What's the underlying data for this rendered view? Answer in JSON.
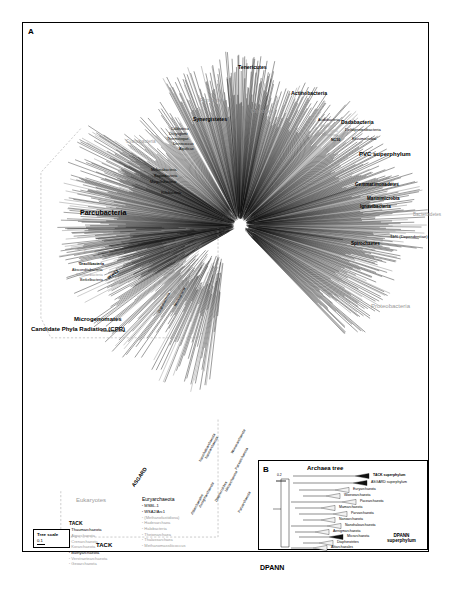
{
  "figure": {
    "panelA_letter": "A",
    "panelB_letter": "B",
    "panelB_title": "Archaea tree",
    "cpr_label": "Candidate Phyla Radiation (CPR)",
    "scale": {
      "title": "Tree scale",
      "value": "0.1"
    },
    "panelB_scale": "0.2"
  },
  "bacteria_labels": [
    {
      "text": "Tenericutes",
      "x": 215,
      "y": 42,
      "size": "s5",
      "style": "b",
      "rot": 0
    },
    {
      "text": "Firmicutes",
      "x": 177,
      "y": 75,
      "size": "s5",
      "style": "g",
      "rot": 0
    },
    {
      "text": "Chloroflexi",
      "x": 228,
      "y": 87,
      "size": "s45",
      "style": "g",
      "rot": 0
    },
    {
      "text": "Actinobacteria",
      "x": 268,
      "y": 68,
      "size": "s5",
      "style": "b",
      "rot": 0
    },
    {
      "text": "Synergistetes",
      "x": 170,
      "y": 94,
      "size": "s5",
      "style": "b",
      "rot": 0
    },
    {
      "text": "Caldiserica",
      "x": 148,
      "y": 105,
      "size": "s35",
      "style": "",
      "rot": 0
    },
    {
      "text": "Dictyoglomi",
      "x": 146,
      "y": 110,
      "size": "s35",
      "style": "",
      "rot": 0
    },
    {
      "text": "Thermotogae",
      "x": 144,
      "y": 115,
      "size": "s35",
      "style": "",
      "rot": 0
    },
    {
      "text": "Deinococcus",
      "x": 150,
      "y": 120,
      "size": "s35",
      "style": "",
      "rot": 0
    },
    {
      "text": "Aquificae",
      "x": 156,
      "y": 125,
      "size": "s35",
      "style": "",
      "rot": 0
    },
    {
      "text": "Cyanobacteria",
      "x": 103,
      "y": 117,
      "size": "s45",
      "style": "g",
      "rot": 0
    },
    {
      "text": "Melainabacteria",
      "x": 128,
      "y": 146,
      "size": "s35",
      "style": "",
      "rot": 0
    },
    {
      "text": "Saganbacteria",
      "x": 131,
      "y": 152,
      "size": "s35",
      "style": "",
      "rot": 0
    },
    {
      "text": "Margulisbacteria",
      "x": 127,
      "y": 158,
      "size": "s35",
      "style": "",
      "rot": 0
    },
    {
      "text": "Riflebacteria",
      "x": 138,
      "y": 169,
      "size": "s35",
      "style": "",
      "rot": 0
    },
    {
      "text": "Acidobacteria",
      "x": 295,
      "y": 96,
      "size": "s35",
      "style": "",
      "rot": 0
    },
    {
      "text": "Nitrospinae",
      "x": 297,
      "y": 102,
      "size": "s3",
      "style": "g2",
      "rot": 0
    },
    {
      "text": "Tectomicrobia",
      "x": 296,
      "y": 107,
      "size": "s3",
      "style": "g2",
      "rot": 0
    },
    {
      "text": "Nitrospirae",
      "x": 299,
      "y": 111,
      "size": "s3",
      "style": "g",
      "rot": 0
    },
    {
      "text": "NC10",
      "x": 308,
      "y": 116,
      "size": "s35",
      "style": "b",
      "rot": 0
    },
    {
      "text": "Dadabacteria",
      "x": 318,
      "y": 97,
      "size": "s5",
      "style": "b",
      "rot": 0
    },
    {
      "text": "Deltaproteobacteria",
      "x": 322,
      "y": 105,
      "size": "s4",
      "style": "",
      "rot": 0
    },
    {
      "text": "Elusimicrobia",
      "x": 329,
      "y": 114,
      "size": "s4",
      "style": "",
      "rot": 0
    },
    {
      "text": "PVC superphylum",
      "x": 336,
      "y": 128,
      "size": "s6",
      "style": "b",
      "rot": 0
    },
    {
      "text": "Gemmatimonadetes",
      "x": 332,
      "y": 160,
      "size": "s45",
      "style": "b",
      "rot": 0
    },
    {
      "text": "Zixibacteria",
      "x": 336,
      "y": 167,
      "size": "s4",
      "style": "g",
      "rot": 0
    },
    {
      "text": "Marinimicrobia",
      "x": 344,
      "y": 174,
      "size": "s45",
      "style": "b",
      "rot": 0
    },
    {
      "text": "Ignavibacteria",
      "x": 337,
      "y": 182,
      "size": "s45",
      "style": "b",
      "rot": 0
    },
    {
      "text": "Bacteroidetes",
      "x": 390,
      "y": 190,
      "size": "s45",
      "style": "g",
      "rot": 0
    },
    {
      "text": "TM6 (Dependentiae)",
      "x": 367,
      "y": 212,
      "size": "s4",
      "style": "",
      "rot": 0
    },
    {
      "text": "Spirochaetes",
      "x": 328,
      "y": 219,
      "size": "s45",
      "style": "b",
      "rot": 0
    },
    {
      "text": "Proteobacteria",
      "x": 348,
      "y": 280,
      "size": "s6",
      "style": "g",
      "rot": 0
    },
    {
      "text": "Parcubacteria",
      "x": 57,
      "y": 186,
      "size": "s7",
      "style": "b",
      "rot": 0
    },
    {
      "text": "Doudnabacteria",
      "x": 61,
      "y": 228,
      "size": "s35",
      "style": "g",
      "rot": 0
    },
    {
      "text": "Peregrinibacteria",
      "x": 57,
      "y": 234,
      "size": "s35",
      "style": "g",
      "rot": 0
    },
    {
      "text": "Gracilibacteria",
      "x": 56,
      "y": 240,
      "size": "s35",
      "style": "b",
      "rot": 0
    },
    {
      "text": "Absconditabacteria",
      "x": 49,
      "y": 246,
      "size": "s35",
      "style": "",
      "rot": 0
    },
    {
      "text": "Saccharibacteria",
      "x": 53,
      "y": 251,
      "size": "s35",
      "style": "g",
      "rot": 0
    },
    {
      "text": "Berkelbacteria",
      "x": 57,
      "y": 256,
      "size": "s35",
      "style": "",
      "rot": 0
    },
    {
      "text": "WWE3",
      "x": 84,
      "y": 254,
      "size": "s4",
      "style": "b",
      "rot": -38
    },
    {
      "text": "Microgenomates",
      "x": 51,
      "y": 293,
      "size": "s6",
      "style": "b",
      "rot": 0
    },
    {
      "text": "Katanobacteria",
      "x": 78,
      "y": 307,
      "size": "s35",
      "style": "",
      "rot": 0
    },
    {
      "text": "Dojkabacteria",
      "x": 135,
      "y": 289,
      "size": "s35",
      "style": "",
      "rot": -62
    },
    {
      "text": "Wirthbacteria",
      "x": 151,
      "y": 283,
      "size": "s35",
      "style": "",
      "rot": -62
    }
  ],
  "archaea_labels": [
    {
      "text": "Eukaryotes",
      "x": 53,
      "y": 474,
      "size": "s6",
      "style": "g",
      "rot": 0
    },
    {
      "text": "ASGARD",
      "x": 108,
      "y": 462,
      "size": "s5",
      "style": "b",
      "rot": -55
    },
    {
      "text": "TACK",
      "x": 73,
      "y": 519,
      "size": "s6",
      "style": "b",
      "rot": 0
    },
    {
      "text": "DPANN",
      "x": 237,
      "y": 541,
      "size": "s7",
      "style": "b",
      "rot": 0
    }
  ],
  "dpann_labels": [
    {
      "text": "Nanoarchaeota",
      "x": 182,
      "y": 435,
      "rot": -62
    },
    {
      "text": "Nanohaloarchaeota",
      "x": 176,
      "y": 438,
      "rot": -62
    },
    {
      "text": "Woesearchaeota",
      "x": 208,
      "y": 430,
      "rot": -62
    },
    {
      "text": "Pacearchaeota",
      "x": 212,
      "y": 446,
      "rot": -62
    },
    {
      "text": "Micrarchaeota",
      "x": 202,
      "y": 468,
      "rot": -62
    },
    {
      "text": "Diapherotrites",
      "x": 192,
      "y": 478,
      "rot": -62
    },
    {
      "text": "Aenigmarchaeota",
      "x": 176,
      "y": 484,
      "rot": -62
    },
    {
      "text": "Altiarchaeales",
      "x": 168,
      "y": 491,
      "rot": -62
    },
    {
      "text": "Parvarchaeota",
      "x": 215,
      "y": 489,
      "rot": -62
    }
  ],
  "tack_list": {
    "header": "TACK",
    "items": [
      {
        "name": "Thaumarchaeota",
        "gray": false
      },
      {
        "name": "Aigarchaeota",
        "gray": true
      },
      {
        "name": "Crenarchaeota",
        "gray": true
      },
      {
        "name": "Korarchaeota",
        "gray": true
      },
      {
        "name": "Bathyarchaeota",
        "gray": false
      },
      {
        "name": "Verstraetearchaeota",
        "gray": true
      },
      {
        "name": "Geoarchaeota",
        "gray": true
      }
    ]
  },
  "eury_list": {
    "header": "Euryarchaeota",
    "items": [
      {
        "name": "MSBL-1",
        "gray": false
      },
      {
        "name": "WSA2/Arc1",
        "gray": false
      },
      {
        "name": "(Methanofastidiosa)",
        "gray": true
      },
      {
        "name": "Hadesarchaea",
        "gray": true
      },
      {
        "name": "Halobacteria",
        "gray": true
      },
      {
        "name": "Theionarchaea",
        "gray": true
      },
      {
        "name": "Thalassarchaea",
        "gray": true
      },
      {
        "name": "Methanomassiliicoccus",
        "gray": true
      }
    ]
  },
  "panelB_taxa": [
    {
      "name": "TACK superphylum",
      "bold": true,
      "x": 112,
      "y": 14,
      "dark": true
    },
    {
      "name": "ASGARD superphylum",
      "bold": false,
      "x": 110,
      "y": 21,
      "dark": true
    },
    {
      "name": "Euryarchaeota",
      "bold": false,
      "x": 92,
      "y": 28,
      "dark": false
    },
    {
      "name": "Woesearchaeota",
      "bold": false,
      "x": 83,
      "y": 34,
      "dark": false
    },
    {
      "name": "Pacearchaeota",
      "bold": false,
      "x": 99,
      "y": 40,
      "dark": false
    },
    {
      "name": "Mamarchaeota",
      "bold": false,
      "x": 78,
      "y": 46,
      "dark": false
    },
    {
      "name": "Parvarchaeota",
      "bold": false,
      "x": 90,
      "y": 52,
      "dark": false
    },
    {
      "name": "Nanoarchaeota",
      "bold": false,
      "x": 78,
      "y": 58,
      "dark": false
    },
    {
      "name": "Nanohaloarchaeota",
      "bold": false,
      "x": 84,
      "y": 64,
      "dark": false
    },
    {
      "name": "Aenigmarchaeota",
      "bold": false,
      "x": 72,
      "y": 70,
      "dark": false
    },
    {
      "name": "Micrarchaeota",
      "bold": false,
      "x": 86,
      "y": 75,
      "dark": true
    },
    {
      "name": "Diapherotrites",
      "bold": false,
      "x": 76,
      "y": 81,
      "dark": false
    },
    {
      "name": "Altiarchaeales",
      "bold": false,
      "x": 70,
      "y": 86,
      "dark": false
    }
  ],
  "panelB_dpann": {
    "line1": "DPANN",
    "line2": "superphylum",
    "x": 128,
    "y": 72
  }
}
